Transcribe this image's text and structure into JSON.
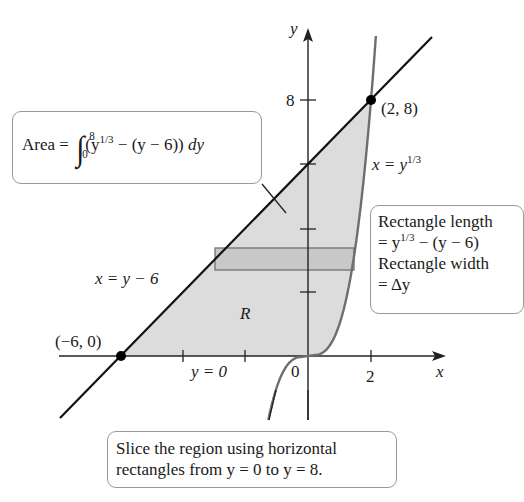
{
  "figure": {
    "axes": {
      "x_label": "x",
      "y_label": "y",
      "x_ticks": [
        {
          "value": 0,
          "label": "0"
        },
        {
          "value": 2,
          "label": "2"
        }
      ],
      "y_ticks": [
        {
          "value": 8,
          "label": "8"
        }
      ],
      "origin_px": [
        308,
        356
      ],
      "px_per_unit_x": 31.5,
      "px_per_unit_y": 32
    },
    "curves": [
      {
        "name": "line",
        "equation": "x = y - 6",
        "label_lhs": "x = y − 6",
        "color": "#111111"
      },
      {
        "name": "cube-root",
        "equation": "x = y^(1/3)",
        "label_base": "x = y",
        "label_exp": "1/3",
        "color": "#6e6e6e"
      }
    ],
    "points": [
      {
        "label": "(−6, 0)",
        "x": -6,
        "y": 0
      },
      {
        "label": "(2, 8)",
        "x": 2,
        "y": 8
      }
    ],
    "region_label": "R",
    "region_fill": "#dcdcdc",
    "rectangle_fill": "#c8c8c8",
    "y_zero_label": "y = 0",
    "callouts": {
      "area": {
        "prefix": "Area =",
        "upper": "8",
        "lower": "0",
        "integrand_open": "(y",
        "exp": "1/3",
        "integrand_rest": " − (y − 6)) ",
        "diff": "dy"
      },
      "rectangle": {
        "line1": "Rectangle length",
        "line2_pre": "= y",
        "line2_exp": "1/3",
        "line2_post": " − (y − 6)",
        "line3": "Rectangle width",
        "line4": "= Δy"
      },
      "slice": {
        "line1": "Slice the region using horizontal",
        "line2": "rectangles from y = 0 to y = 8."
      }
    }
  }
}
